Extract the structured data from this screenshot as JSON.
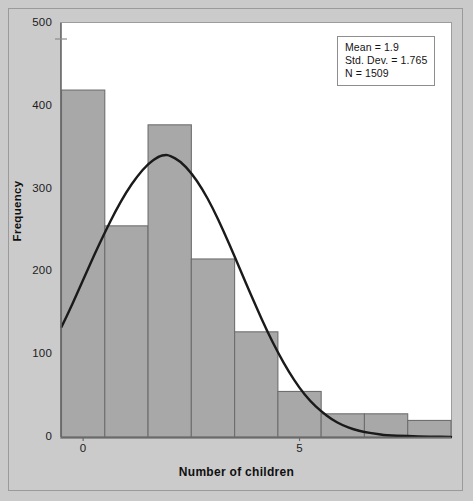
{
  "chart_data": {
    "type": "bar",
    "title": "",
    "subtitle": "",
    "xlabel": "Number of children",
    "ylabel": "Frequency",
    "categories": [
      "0",
      "1",
      "2",
      "3",
      "4",
      "5",
      "6",
      "7",
      "8"
    ],
    "x": [
      0,
      1,
      2,
      3,
      4,
      5,
      6,
      7,
      8
    ],
    "values": [
      419,
      255,
      377,
      215,
      127,
      55,
      28,
      28,
      20
    ],
    "bar_color": "#a8a8a8",
    "bar_edge_color": "#6e6e6e",
    "xlim": [
      -0.5,
      8.5
    ],
    "ylim": [
      0,
      500
    ],
    "ytick_values": [
      0,
      100,
      200,
      300,
      400,
      500
    ],
    "ytick_labels": [
      "0",
      "100",
      "200",
      "300",
      "400",
      "500"
    ],
    "xtick_values": [
      0,
      5
    ],
    "xtick_labels": [
      "0",
      "5"
    ],
    "grid": false,
    "legend_position": "top-right",
    "overlay": {
      "type": "line",
      "name": "normal-curve",
      "color": "#1a1a1a",
      "peak_value": 341,
      "peak_x": 1.9,
      "start_value": 133,
      "points": [
        [
          -0.5,
          133
        ],
        [
          -0.25,
          160
        ],
        [
          0,
          190
        ],
        [
          0.25,
          219
        ],
        [
          0.5,
          247
        ],
        [
          0.75,
          273
        ],
        [
          1.0,
          296
        ],
        [
          1.25,
          315
        ],
        [
          1.5,
          330
        ],
        [
          1.75,
          339
        ],
        [
          1.9,
          341
        ],
        [
          2.0,
          340
        ],
        [
          2.25,
          333
        ],
        [
          2.5,
          319
        ],
        [
          2.75,
          300
        ],
        [
          3.0,
          276
        ],
        [
          3.25,
          248
        ],
        [
          3.5,
          218
        ],
        [
          3.75,
          187
        ],
        [
          4.0,
          157
        ],
        [
          4.25,
          128
        ],
        [
          4.5,
          102
        ],
        [
          4.75,
          79
        ],
        [
          5.0,
          59
        ],
        [
          5.25,
          43
        ],
        [
          5.5,
          31
        ],
        [
          5.75,
          21
        ],
        [
          6.0,
          14
        ],
        [
          6.25,
          9
        ],
        [
          6.5,
          6
        ],
        [
          6.75,
          4
        ],
        [
          7.0,
          2
        ],
        [
          7.5,
          1
        ],
        [
          8.0,
          0.4
        ],
        [
          8.5,
          0.2
        ]
      ]
    }
  },
  "stats_legend": {
    "mean_label": "Mean = 1.9",
    "std_dev_label": "Std. Dev. = 1.765",
    "n_label": "N = 1509"
  },
  "colors": {
    "figure_background": "#cacaca",
    "panel_background": "#ffffff",
    "bar_fill": "#a8a8a8",
    "bar_stroke": "#6e6e6e",
    "curve": "#1a1a1a",
    "axis": "#5a5a5a",
    "text": "#101010"
  }
}
